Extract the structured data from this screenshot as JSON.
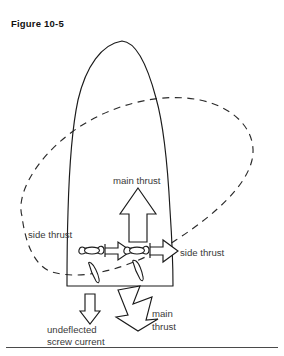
{
  "figure": {
    "caption": "Figure 10-5",
    "domain": "Diagram"
  },
  "colors": {
    "background": "#ffffff",
    "line": "#1b1b1b",
    "dashed_line": "#2a2a2a",
    "label_text": "#3a3a3a",
    "caption_text": "#111111",
    "rule": "#4a4a4a"
  },
  "labels": {
    "main_thrust_top": "main thrust",
    "side_thrust_left": "side thrust",
    "side_thrust_right": "side thrust",
    "undeflected": "undeflected",
    "screw_current": "screw current",
    "main_thrust_bottom_line1": "main",
    "main_thrust_bottom_line2": "thrust"
  },
  "elements": {
    "hull_name": "boat-hull-outline",
    "pivot_name": "pivot-circle-dashed",
    "arrows": [
      {
        "name": "main-thrust-arrow",
        "direction": "up",
        "style": "hollow-outline"
      },
      {
        "name": "side-thrust-arrow-left",
        "direction": "right",
        "style": "hollow-outline"
      },
      {
        "name": "side-thrust-arrow-right",
        "direction": "right",
        "style": "hollow-outline"
      },
      {
        "name": "undeflected-screw-current-arrow",
        "direction": "down",
        "style": "hollow-outline"
      },
      {
        "name": "main-thrust-arrow-bottom",
        "direction": "down-right",
        "style": "hollow-outline"
      }
    ],
    "propellers": [
      {
        "name": "propeller-glyph-left"
      },
      {
        "name": "propeller-glyph-right"
      }
    ],
    "rudders": [
      {
        "name": "rudder-blade-left"
      },
      {
        "name": "rudder-blade-right"
      }
    ]
  },
  "rule": {
    "name": "bottom-horizontal-rule"
  }
}
